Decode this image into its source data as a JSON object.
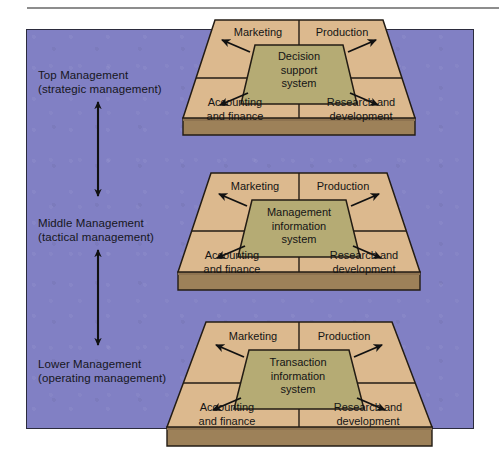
{
  "figure": {
    "colors": {
      "panel_background": "#8180c4",
      "panel_border": "#2b2b3d",
      "platform_face": "#dcb98e",
      "platform_edge": "#8c6a45",
      "platform_slab": "#9d8159",
      "inner_system": "#b5ab74",
      "outline": "#231c14",
      "text": "#141414",
      "top_rule": "#8d8d8d"
    },
    "levels": [
      {
        "id": "top",
        "label_line1": "Top Management",
        "label_line2": "(strategic management)",
        "system_name": [
          "Decision",
          "support",
          "system"
        ],
        "functions": {
          "top_left": [
            "Marketing"
          ],
          "top_right": [
            "Production"
          ],
          "bottom_left": [
            "Accounting",
            "and finance"
          ],
          "bottom_right": [
            "Research and",
            "development"
          ]
        }
      },
      {
        "id": "middle",
        "label_line1": "Middle Management",
        "label_line2": "(tactical management)",
        "system_name": [
          "Management",
          "information",
          "system"
        ],
        "functions": {
          "top_left": [
            "Marketing"
          ],
          "top_right": [
            "Production"
          ],
          "bottom_left": [
            "Accounting",
            "and finance"
          ],
          "bottom_right": [
            "Research and",
            "development"
          ]
        }
      },
      {
        "id": "lower",
        "label_line1": "Lower Management",
        "label_line2": "(operating management)",
        "system_name": [
          "Transaction",
          "information",
          "system"
        ],
        "functions": {
          "top_left": [
            "Marketing"
          ],
          "top_right": [
            "Production"
          ],
          "bottom_left": [
            "Accounting",
            "and finance"
          ],
          "bottom_right": [
            "Research and",
            "development"
          ]
        }
      }
    ],
    "connectors": {
      "between_top_and_middle": "double-headed vertical arrow",
      "between_middle_and_lower": "double-headed vertical arrow"
    },
    "flow_arrows_per_level": 4
  },
  "labels": {
    "top": {
      "line1": "Top Management",
      "line2": "(strategic management)",
      "sys1": "Decision",
      "sys2": "support",
      "sys3": "system",
      "marketing": "Marketing",
      "production": "Production",
      "acct1": "Accounting",
      "acct2": "and finance",
      "rnd1": "Research and",
      "rnd2": "development"
    },
    "middle": {
      "line1": "Middle Management",
      "line2": "(tactical management)",
      "sys1": "Management",
      "sys2": "information",
      "sys3": "system",
      "marketing": "Marketing",
      "production": "Production",
      "acct1": "Accounting",
      "acct2": "and finance",
      "rnd1": "Research and",
      "rnd2": "development"
    },
    "lower": {
      "line1": "Lower Management",
      "line2": "(operating management)",
      "sys1": "Transaction",
      "sys2": "information",
      "sys3": "system",
      "marketing": "Marketing",
      "production": "Production",
      "acct1": "Accounting",
      "acct2": "and finance",
      "rnd1": "Research and",
      "rnd2": "development"
    }
  }
}
